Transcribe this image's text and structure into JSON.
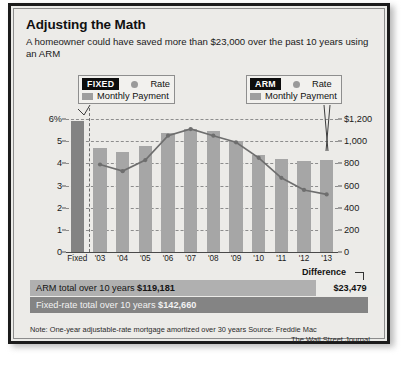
{
  "header": {
    "title": "Adjusting the Math",
    "subtitle": "A homeowner could have saved more than $23,000 over the past 10 years using an ARM"
  },
  "legends": {
    "fixed": {
      "tag": "FIXED",
      "rate_label": "Rate",
      "payment_label": "Monthly Payment"
    },
    "arm": {
      "tag": "ARM",
      "rate_label": "Rate",
      "payment_label": "Monthly Payment"
    }
  },
  "totals": {
    "difference_label": "Difference",
    "difference_value": "$23,479",
    "arm_text": "ARM total over 10 years ",
    "arm_value": "$119,181",
    "fixed_text": "Fixed-rate total over 10 years ",
    "fixed_value": "$142,660"
  },
  "footer": {
    "note": "Note: One-year adjustable-rate mortgage amortized over 30 years\nSource: Freddie Mac",
    "credit": "The Wall Street Journal"
  },
  "colors": {
    "bar": "#a6a6a6",
    "bar_fixed": "#838383",
    "line": "#6e6e6e",
    "panel": "#ecebe8",
    "border": "#1b1b1b"
  },
  "chart_data": {
    "type": "bar",
    "title": "Adjusting the Math",
    "categories": [
      "Fixed",
      "'03",
      "'04",
      "'05",
      "'06",
      "'07",
      "'08",
      "'09",
      "'10",
      "'11",
      "'12",
      "'13"
    ],
    "series": [
      {
        "name": "Monthly Payment",
        "type": "bar",
        "axis": "right",
        "unit": "$",
        "values": [
          1180,
          940,
          905,
          960,
          1075,
          1110,
          1090,
          1000,
          880,
          840,
          825,
          830
        ]
      },
      {
        "name": "Rate",
        "type": "line",
        "axis": "left",
        "unit": "%",
        "values": [
          null,
          3.95,
          3.65,
          4.15,
          5.25,
          5.55,
          5.25,
          4.95,
          4.25,
          3.35,
          2.8,
          2.6
        ]
      }
    ],
    "ylabel": "",
    "ylabel_right": "",
    "ylim": [
      0,
      6.5
    ],
    "ylim_right": [
      0,
      1300
    ],
    "yticks": [
      "0",
      "1",
      "2",
      "3",
      "4",
      "5",
      "6%"
    ],
    "ytick_values": [
      0,
      1,
      2,
      3,
      4,
      5,
      6
    ],
    "yticks_right": [
      "0",
      "200",
      "400",
      "600",
      "800",
      "1,000",
      "$1,200"
    ],
    "ytick_values_right": [
      0,
      200,
      400,
      600,
      800,
      1000,
      1200
    ],
    "grid": true,
    "legend": [
      "Rate",
      "Monthly Payment"
    ]
  }
}
